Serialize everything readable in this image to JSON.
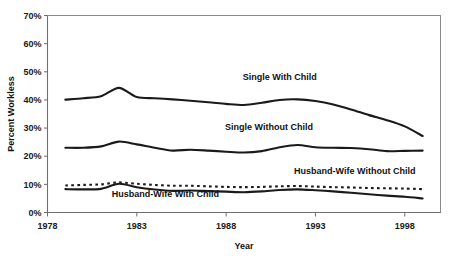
{
  "chart_data": {
    "type": "line",
    "title": "",
    "xlabel": "Year",
    "ylabel": "Percent Workless",
    "xlim": [
      1978,
      2000
    ],
    "ylim": [
      0,
      70
    ],
    "xticks": [
      1978,
      1983,
      1988,
      1993,
      1998
    ],
    "xtick_labels": [
      "1978",
      "1983",
      "1988",
      "1993",
      "1998"
    ],
    "yticks": [
      0,
      10,
      20,
      30,
      40,
      50,
      60,
      70
    ],
    "ytick_labels": [
      "0%",
      "10%",
      "20%",
      "30%",
      "40%",
      "50%",
      "60%",
      "70%"
    ],
    "grid": false,
    "legend_position": "inline-annotations",
    "x": [
      1979,
      1980,
      1981,
      1982,
      1983,
      1984,
      1985,
      1986,
      1987,
      1988,
      1989,
      1990,
      1991,
      1992,
      1993,
      1994,
      1995,
      1996,
      1997,
      1998,
      1999
    ],
    "series": [
      {
        "name": "Single With Child",
        "style": "solid",
        "label_x": 1991,
        "label_y": 47,
        "values": [
          40.1,
          40.6,
          41.3,
          44.3,
          41.0,
          40.6,
          40.2,
          39.7,
          39.2,
          38.6,
          38.2,
          39.0,
          40.0,
          40.2,
          39.6,
          38.4,
          36.6,
          34.6,
          32.8,
          30.6,
          27.2
        ]
      },
      {
        "name": "Single Without Child",
        "style": "solid",
        "label_x": 1990.4,
        "label_y": 29.3,
        "values": [
          23.0,
          23.0,
          23.5,
          25.2,
          24.2,
          23.0,
          22.0,
          22.3,
          22.0,
          21.6,
          21.3,
          21.8,
          23.2,
          24.0,
          23.2,
          23.0,
          22.9,
          22.5,
          21.8,
          21.9,
          22.0
        ]
      },
      {
        "name": "Husband-Wife Without Child",
        "style": "dashed",
        "label_x": 1995.2,
        "label_y": 13.6,
        "values": [
          9.6,
          9.8,
          10.0,
          10.7,
          10.2,
          9.8,
          9.5,
          9.5,
          9.3,
          9.1,
          9.0,
          9.1,
          9.3,
          9.4,
          9.2,
          9.0,
          8.9,
          8.7,
          8.6,
          8.5,
          8.3
        ]
      },
      {
        "name": "Husband-Wife With Child",
        "style": "solid",
        "label_x": 1984.6,
        "label_y": 5.4,
        "values": [
          8.3,
          8.2,
          8.4,
          10.2,
          9.0,
          8.2,
          7.7,
          7.8,
          7.6,
          7.4,
          7.2,
          7.5,
          8.0,
          8.2,
          7.9,
          7.5,
          7.0,
          6.5,
          6.0,
          5.6,
          5.0
        ]
      }
    ]
  },
  "caption": {
    "ghost_text": ""
  }
}
